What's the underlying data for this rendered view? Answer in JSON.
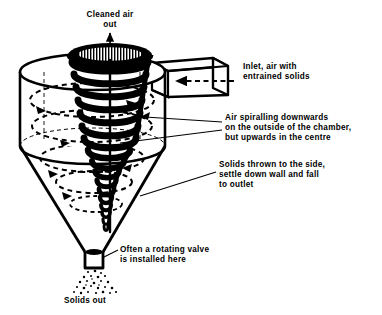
{
  "diagram": {
    "type": "process-equipment-diagram",
    "background_color": "#ffffff",
    "ink_color": "#000000",
    "labels": {
      "cleaned_air_out": "Cleaned air\nout",
      "inlet": "Inlet, air with\nentrained solids",
      "air_spiralling": "Air spiralling downwards\non the outside of the chamber,\nbut upwards in the centre",
      "solids_thrown": "Solids thrown to the side,\nsettle down wall and fall\nto outlet",
      "rotating_valve": "Often a rotating valve\nis installed here",
      "solids_out": "Solids out"
    },
    "parts": [
      {
        "name": "vortex-finder",
        "description": "central outlet tube at top of cylinder"
      },
      {
        "name": "cylinder-body",
        "description": "upper cylindrical chamber"
      },
      {
        "name": "inlet-duct",
        "description": "rectangular tangential inlet duct at right"
      },
      {
        "name": "cone-body",
        "description": "lower conical section"
      },
      {
        "name": "solids-outlet",
        "description": "narrow discharge tube at cone apex"
      },
      {
        "name": "helix-flow",
        "description": "solid black helical vortex path"
      },
      {
        "name": "dashed-swirl",
        "description": "dashed elliptical air-flow paths"
      },
      {
        "name": "dust-plume",
        "description": "speckled falling solids below outlet"
      }
    ],
    "flow_arrows": {
      "cleaned_air_out": "up",
      "inlet_air": "left",
      "swirl": "clockwise-descending"
    }
  }
}
